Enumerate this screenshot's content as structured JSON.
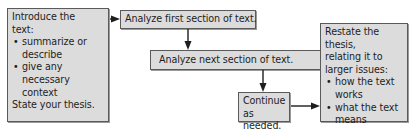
{
  "diagram": {
    "type": "flowchart",
    "colors": {
      "box_fill": "#dcdcdc",
      "box_border": "#5a5a5a",
      "arrow": "#1e1e1e",
      "text": "#1e1e1e"
    },
    "nodes": [
      {
        "id": "intro",
        "lines": [
          "Introduce the",
          "text:"
        ],
        "bullets": [
          "summarize or describe",
          "give any necessary context"
        ],
        "footer": "State your thesis."
      },
      {
        "id": "first",
        "text": "Analyze first section of text."
      },
      {
        "id": "next",
        "text": "Analyze next section of text."
      },
      {
        "id": "continue",
        "lines": [
          "Continue",
          "as needed."
        ]
      },
      {
        "id": "restate",
        "lines": [
          "Restate the thesis,",
          "relating it to",
          "larger issues:"
        ],
        "bullets": [
          "how the text works",
          "what the text means"
        ]
      }
    ],
    "edges": [
      {
        "from": "intro",
        "to": "first",
        "direction": "right"
      },
      {
        "from": "first",
        "to": "next",
        "direction": "down"
      },
      {
        "from": "next",
        "to": "continue",
        "direction": "down"
      },
      {
        "from": "continue",
        "to": "restate",
        "direction": "right"
      }
    ]
  }
}
